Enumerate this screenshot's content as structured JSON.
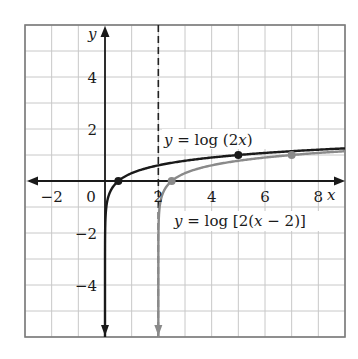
{
  "chart_data": {
    "type": "line",
    "title": "",
    "xlabel": "x",
    "ylabel": "y",
    "xlim": [
      -3,
      9
    ],
    "ylim": [
      -6,
      6
    ],
    "grid": true,
    "x_ticks": [
      {
        "value": -2,
        "label": "−2"
      },
      {
        "value": 0,
        "label": "0"
      },
      {
        "value": 2,
        "label": "2"
      },
      {
        "value": 4,
        "label": "4"
      },
      {
        "value": 6,
        "label": "6"
      },
      {
        "value": 8,
        "label": "8"
      }
    ],
    "y_ticks": [
      {
        "value": 4,
        "label": "4"
      },
      {
        "value": 2,
        "label": "2"
      },
      {
        "value": -2,
        "label": "−2"
      },
      {
        "value": -4,
        "label": "−4"
      }
    ],
    "asymptote": {
      "x": 2,
      "style": "dashed"
    },
    "series": [
      {
        "name": "y = log (2x)",
        "color": "#1a1a1a",
        "function": "log10(2x)",
        "domain": [
          0,
          9
        ],
        "marked_points": [
          [
            0.5,
            0
          ],
          [
            5,
            1
          ]
        ]
      },
      {
        "name": "y = log [2(x − 2)]",
        "color": "#8a8a8a",
        "function": "log10(2(x-2))",
        "domain": [
          2,
          9
        ],
        "marked_points": [
          [
            2.5,
            0
          ],
          [
            7,
            1
          ]
        ]
      }
    ],
    "annotations": [
      {
        "text": "y = log (2x)",
        "near": [
          5,
          1.3
        ]
      },
      {
        "text": "y = log [2(x − 2)]",
        "near": [
          6,
          -1.1
        ]
      }
    ]
  },
  "labels": {
    "x_axis": "x",
    "y_axis": "y",
    "curve1": {
      "y": "y",
      "eq": " = log (2",
      "x": "x",
      "close": ")"
    },
    "curve2": {
      "y": "y",
      "eq": " = log [2(",
      "x": "x",
      "rest": " − 2)]"
    }
  }
}
